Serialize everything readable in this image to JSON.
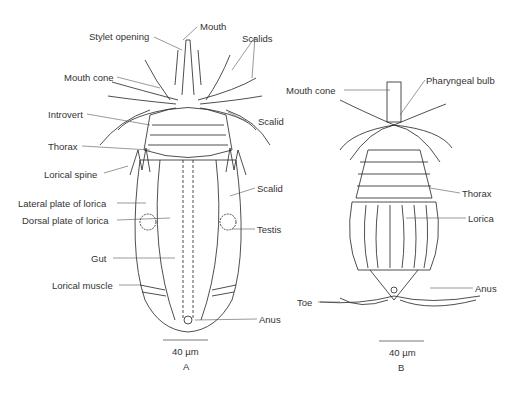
{
  "figure_a": {
    "caption": "A",
    "scale_bar": "40 µm",
    "labels": {
      "mouth": "Mouth",
      "stylet_opening": "Stylet opening",
      "scalids_top": "Scalids",
      "mouth_cone": "Mouth cone",
      "introvert": "Introvert",
      "scalid_1": "Scalid",
      "thorax": "Thorax",
      "lorical_spine": "Lorical spine",
      "scalid_2": "Scalid",
      "lateral_plate": "Lateral plate of lorica",
      "dorsal_plate": "Dorsal plate of lorica",
      "testis": "Testis",
      "gut": "Gut",
      "lorical_muscle": "Lorical muscle",
      "anus": "Anus"
    }
  },
  "figure_b": {
    "caption": "B",
    "scale_bar": "40 µm",
    "labels": {
      "mouth_cone": "Mouth cone",
      "pharyngeal_bulb": "Pharyngeal bulb",
      "thorax": "Thorax",
      "lorica": "Lorica",
      "anus": "Anus",
      "toe": "Toe"
    }
  }
}
